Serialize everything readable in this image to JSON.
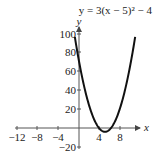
{
  "chart_data": {
    "type": "line",
    "title": "y = 3(x − 5)² − 4",
    "xlabel": "x",
    "ylabel": "y",
    "x_ticks": [
      -12,
      -8,
      -4,
      4,
      8
    ],
    "y_ticks": [
      100,
      80,
      60,
      40,
      20,
      -20
    ],
    "x_tick_labels": [
      "−12",
      "−8",
      "−4",
      "4",
      "8"
    ],
    "y_tick_labels": [
      "100",
      "80",
      "60",
      "40",
      "20",
      "−20"
    ],
    "xlim": [
      -12,
      11
    ],
    "ylim": [
      -20,
      100
    ],
    "function": "3*(x-5)^2-4",
    "vertex": [
      5,
      -4
    ],
    "grid": false,
    "legend": "none",
    "series": [
      {
        "name": "y = 3(x-5)^2 - 4",
        "x": [
          -0.8,
          0,
          1,
          2,
          3,
          4,
          5,
          6,
          7,
          8,
          9,
          10.8
        ],
        "y": [
          96.9,
          71,
          44,
          23,
          8,
          -1,
          -4,
          -1,
          8,
          23,
          44,
          96.9
        ]
      }
    ]
  }
}
